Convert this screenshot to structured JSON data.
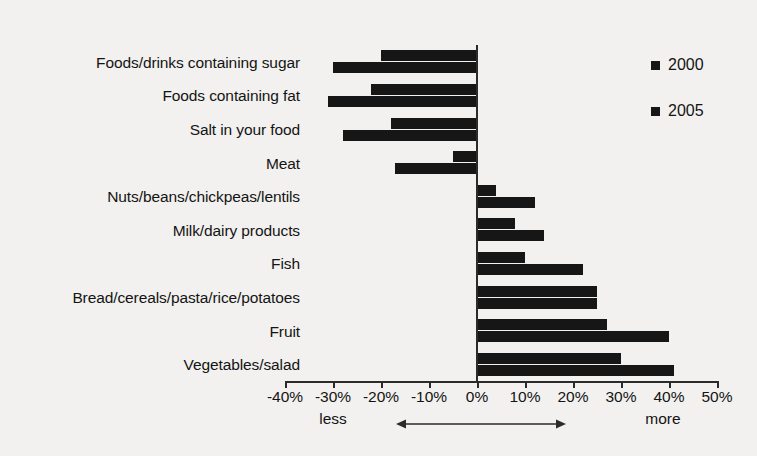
{
  "chart_data": {
    "type": "bar",
    "orientation": "horizontal",
    "title": "",
    "subtitle": "",
    "xlabel": "",
    "ylabel": "",
    "xlim": [
      -40,
      50
    ],
    "xtick_step": 10,
    "grid": false,
    "legend_position": "right",
    "value_unit": "%",
    "categories": [
      "Foods/drinks containing sugar",
      "Foods containing fat",
      "Salt in your food",
      "Meat",
      "Nuts/beans/chickpeas/lentils",
      "Milk/dairy products",
      "Fish",
      "Bread/cereals/pasta/rice/potatoes",
      "Fruit",
      "Vegetables/salad"
    ],
    "series": [
      {
        "name": "2000",
        "color": "#161616",
        "values": [
          -20,
          -22,
          -18,
          -5,
          4,
          8,
          10,
          25,
          27,
          30
        ]
      },
      {
        "name": "2005",
        "color": "#161616",
        "values": [
          -30,
          -31,
          -28,
          -17,
          12,
          14,
          22,
          25,
          40,
          41
        ]
      }
    ],
    "xticks": [
      {
        "value": -40,
        "label": "-40%"
      },
      {
        "value": -30,
        "label": "-30%"
      },
      {
        "value": -20,
        "label": "-20%"
      },
      {
        "value": -10,
        "label": "-10%"
      },
      {
        "value": 0,
        "label": "0%"
      },
      {
        "value": 10,
        "label": "10%"
      },
      {
        "value": 20,
        "label": "20%"
      },
      {
        "value": 30,
        "label": "30%"
      },
      {
        "value": 40,
        "label": "40%"
      },
      {
        "value": 50,
        "label": "50%"
      }
    ],
    "annotations": {
      "left_end_label": "less",
      "right_end_label": "more",
      "arrow": "double-headed-horizontal-arrow"
    }
  },
  "legend": {
    "items": [
      {
        "label": "2000",
        "color": "#161616"
      },
      {
        "label": "2005",
        "color": "#161616"
      }
    ]
  },
  "colors": {
    "background": "#f2f1ef",
    "bar": "#161616",
    "axis": "#2b2b2b",
    "text": "#141414"
  }
}
